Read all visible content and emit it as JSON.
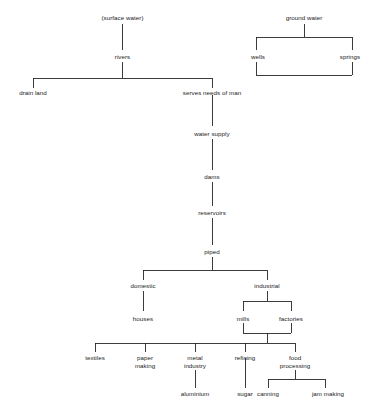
{
  "diagram": {
    "type": "hierarchy-tree",
    "line_color": "#1a1a1a",
    "text_color": "#1a1a1a",
    "background_color": "#ffffff",
    "nodes": {
      "surface_water": "(surface water)",
      "ground_water": "ground water",
      "rivers": "rivers",
      "wells": "wells",
      "springs": "springs",
      "drain_land": "drain land",
      "serves_needs_of_man": "serves needs of man",
      "water_supply": "water supply",
      "dams": "dams",
      "reservoirs": "reservoirs",
      "piped": "piped",
      "domestic": "domestic",
      "industrial": "industrial",
      "houses": "houses",
      "mills": "mills",
      "factories": "factories",
      "textiles": "textiles",
      "paper_making_1": "paper",
      "paper_making_2": "making",
      "metal_industry_1": "metal",
      "metal_industry_2": "industry",
      "refining": "refining",
      "food_processing_1": "food",
      "food_processing_2": "processing",
      "aluminium": "aluminium",
      "sugar": "sugar",
      "canning": "canning",
      "jam_making": "jam making"
    }
  }
}
